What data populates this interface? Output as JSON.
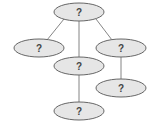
{
  "diagram": {
    "type": "tree",
    "colors": {
      "node_fill": "#e6e6e6",
      "node_stroke": "#666666",
      "edge": "#777777",
      "text": "#444444"
    },
    "nodes": [
      {
        "id": "root",
        "label": "?",
        "cx": 79,
        "cy": 12,
        "rx": 25,
        "ry": 9
      },
      {
        "id": "left",
        "label": "?",
        "cx": 39,
        "cy": 48,
        "rx": 25,
        "ry": 9
      },
      {
        "id": "middle",
        "label": "?",
        "cx": 79,
        "cy": 66,
        "rx": 25,
        "ry": 9
      },
      {
        "id": "right",
        "label": "?",
        "cx": 121,
        "cy": 48,
        "rx": 25,
        "ry": 9
      },
      {
        "id": "right-child",
        "label": "?",
        "cx": 121,
        "cy": 88,
        "rx": 25,
        "ry": 9
      },
      {
        "id": "middle-child",
        "label": "?",
        "cx": 79,
        "cy": 111,
        "rx": 25,
        "ry": 9
      }
    ],
    "edges": [
      {
        "from": "root",
        "to": "left"
      },
      {
        "from": "root",
        "to": "middle"
      },
      {
        "from": "root",
        "to": "right"
      },
      {
        "from": "middle",
        "to": "middle-child"
      },
      {
        "from": "right",
        "to": "right-child"
      }
    ]
  }
}
